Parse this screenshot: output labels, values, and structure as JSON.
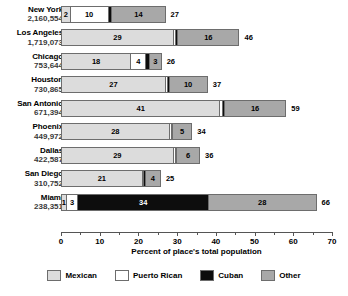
{
  "chart_data": {
    "type": "bar",
    "orientation": "horizontal",
    "stacked": true,
    "title": "",
    "xlabel": "Percent of place's total population",
    "ylabel": "",
    "xlim": [
      0,
      70
    ],
    "xticks": [
      0,
      10,
      20,
      30,
      40,
      50,
      60,
      70
    ],
    "xtick_labels": [
      "0",
      "10",
      "20",
      "30",
      "40",
      "50",
      "60",
      "70"
    ],
    "minor_tick_step": 5,
    "grid": false,
    "legend_position": "bottom",
    "categories": [
      "New York",
      "Los Angeles",
      "Chicago",
      "Houston",
      "San Antonio",
      "Phoenix",
      "Dallas",
      "San Diego",
      "Miami"
    ],
    "category_sublabels": [
      "2,160,554",
      "1,719,073",
      "753,644",
      "730,865",
      "671,394",
      "449,972",
      "422,587",
      "310,752",
      "238,351"
    ],
    "series": [
      {
        "name": "Mexican",
        "color": "#dcdcdc",
        "values": [
          2,
          29,
          18,
          27,
          41,
          28,
          29,
          21,
          1
        ]
      },
      {
        "name": "Puerto Rican",
        "color": "#ffffff",
        "values": [
          10,
          0.6,
          4,
          0.5,
          0.6,
          0.5,
          0.5,
          0.4,
          3
        ]
      },
      {
        "name": "Cuban",
        "color": "#0d0d0d",
        "values": [
          1,
          0.5,
          1,
          0.4,
          0.6,
          0.4,
          0.4,
          0.4,
          34
        ]
      },
      {
        "name": "Other",
        "color": "#a8a8a8",
        "values": [
          14,
          16,
          3,
          10,
          16,
          5,
          6,
          4,
          28
        ]
      }
    ],
    "totals": [
      27,
      46,
      26,
      37,
      59,
      34,
      36,
      25,
      66
    ]
  },
  "rows": [
    {
      "city": "New York",
      "population": "2,160,554",
      "total": "27",
      "segments": [
        {
          "series": "Mexican",
          "value": 2,
          "label": "2",
          "show_label": true
        },
        {
          "series": "Puerto Rican",
          "value": 10,
          "label": "10",
          "show_label": true
        },
        {
          "series": "Cuban",
          "value": 1,
          "label": "1",
          "show_label": false
        },
        {
          "series": "Other",
          "value": 14,
          "label": "14",
          "show_label": true
        }
      ]
    },
    {
      "city": "Los Angeles",
      "population": "1,719,073",
      "total": "46",
      "segments": [
        {
          "series": "Mexican",
          "value": 29,
          "label": "29",
          "show_label": true
        },
        {
          "series": "Puerto Rican",
          "value": 0.6,
          "label": "",
          "show_label": false
        },
        {
          "series": "Cuban",
          "value": 0.5,
          "label": "",
          "show_label": false
        },
        {
          "series": "Other",
          "value": 16,
          "label": "16",
          "show_label": true
        }
      ]
    },
    {
      "city": "Chicago",
      "population": "753,644",
      "total": "26",
      "segments": [
        {
          "series": "Mexican",
          "value": 18,
          "label": "18",
          "show_label": true
        },
        {
          "series": "Puerto Rican",
          "value": 4,
          "label": "4",
          "show_label": true
        },
        {
          "series": "Cuban",
          "value": 1,
          "label": "",
          "show_label": false
        },
        {
          "series": "Other",
          "value": 3,
          "label": "3",
          "show_label": true
        }
      ]
    },
    {
      "city": "Houston",
      "population": "730,865",
      "total": "37",
      "segments": [
        {
          "series": "Mexican",
          "value": 27,
          "label": "27",
          "show_label": true
        },
        {
          "series": "Puerto Rican",
          "value": 0.5,
          "label": "",
          "show_label": false
        },
        {
          "series": "Cuban",
          "value": 0.4,
          "label": "",
          "show_label": false
        },
        {
          "series": "Other",
          "value": 10,
          "label": "10",
          "show_label": true
        }
      ]
    },
    {
      "city": "San Antonio",
      "population": "671,394",
      "total": "59",
      "segments": [
        {
          "series": "Mexican",
          "value": 41,
          "label": "41",
          "show_label": true
        },
        {
          "series": "Puerto Rican",
          "value": 0.6,
          "label": "",
          "show_label": false
        },
        {
          "series": "Cuban",
          "value": 0.6,
          "label": "",
          "show_label": false
        },
        {
          "series": "Other",
          "value": 16,
          "label": "16",
          "show_label": true
        }
      ]
    },
    {
      "city": "Phoenix",
      "population": "449,972",
      "total": "34",
      "segments": [
        {
          "series": "Mexican",
          "value": 28,
          "label": "28",
          "show_label": true
        },
        {
          "series": "Puerto Rican",
          "value": 0.5,
          "label": "",
          "show_label": false
        },
        {
          "series": "Cuban",
          "value": 0.4,
          "label": "",
          "show_label": false
        },
        {
          "series": "Other",
          "value": 5,
          "label": "5",
          "show_label": true
        }
      ]
    },
    {
      "city": "Dallas",
      "population": "422,587",
      "total": "36",
      "segments": [
        {
          "series": "Mexican",
          "value": 29,
          "label": "29",
          "show_label": true
        },
        {
          "series": "Puerto Rican",
          "value": 0.5,
          "label": "",
          "show_label": false
        },
        {
          "series": "Cuban",
          "value": 0.4,
          "label": "",
          "show_label": false
        },
        {
          "series": "Other",
          "value": 6,
          "label": "6",
          "show_label": true
        }
      ]
    },
    {
      "city": "San Diego",
      "population": "310,752",
      "total": "25",
      "segments": [
        {
          "series": "Mexican",
          "value": 21,
          "label": "21",
          "show_label": true
        },
        {
          "series": "Puerto Rican",
          "value": 0.4,
          "label": "",
          "show_label": false
        },
        {
          "series": "Cuban",
          "value": 0.4,
          "label": "",
          "show_label": false
        },
        {
          "series": "Other",
          "value": 4,
          "label": "4",
          "show_label": true
        }
      ]
    },
    {
      "city": "Miami",
      "population": "238,351",
      "total": "66",
      "segments": [
        {
          "series": "Mexican",
          "value": 1,
          "label": "1",
          "show_label": true
        },
        {
          "series": "Puerto Rican",
          "value": 3,
          "label": "3",
          "show_label": true
        },
        {
          "series": "Cuban",
          "value": 34,
          "label": "34",
          "show_label": true
        },
        {
          "series": "Other",
          "value": 28,
          "label": "28",
          "show_label": true
        }
      ]
    }
  ],
  "axis": {
    "title": "Percent of place's total population",
    "ticks": [
      "0",
      "10",
      "20",
      "30",
      "40",
      "50",
      "60",
      "70"
    ]
  },
  "legend": {
    "items": [
      {
        "label": "Mexican",
        "color": "#dcdcdc"
      },
      {
        "label": "Puerto Rican",
        "color": "#ffffff"
      },
      {
        "label": "Cuban",
        "color": "#0d0d0d"
      },
      {
        "label": "Other",
        "color": "#a8a8a8"
      }
    ]
  }
}
